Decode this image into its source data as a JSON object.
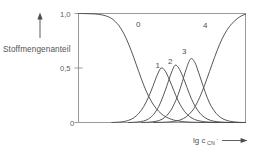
{
  "chart_data": {
    "type": "line",
    "title": "",
    "subtitle": "",
    "ylabel": "Stoffmengenanteil",
    "xlabel": "lg c",
    "xlabel_subscript": "CN",
    "xlabel_superscript": "-",
    "ylim": [
      0,
      1.0
    ],
    "xlim": [
      0,
      1
    ],
    "grid": false,
    "legend_position": "inline-curve-labels",
    "y_ticks": [
      {
        "value": 1.0,
        "label": "1,0"
      },
      {
        "value": 0.5,
        "label": "0,5"
      },
      {
        "value": 0.0,
        "label": "0"
      }
    ],
    "x_ticks": [],
    "x_axis_arrow": true,
    "y_axis_arrow": true,
    "annotations": [
      {
        "text": "0",
        "x": 0.29,
        "y": 0.88
      },
      {
        "text": "1",
        "x": 0.495,
        "y": 0.585
      },
      {
        "text": "2",
        "x": 0.585,
        "y": 0.615
      },
      {
        "text": "3",
        "x": 0.675,
        "y": 0.73
      },
      {
        "text": "4",
        "x": 0.8,
        "y": 0.875
      }
    ],
    "series": [
      {
        "name": "0",
        "label": "0",
        "peak_x": 0.0,
        "peak_y": 1.0,
        "points": [
          [
            0.0,
            1.0
          ],
          [
            0.04,
            0.999
          ],
          [
            0.08,
            0.997
          ],
          [
            0.12,
            0.992
          ],
          [
            0.16,
            0.98
          ],
          [
            0.2,
            0.952
          ],
          [
            0.24,
            0.893
          ],
          [
            0.27,
            0.82
          ],
          [
            0.3,
            0.72
          ],
          [
            0.33,
            0.6
          ],
          [
            0.36,
            0.47
          ],
          [
            0.39,
            0.345
          ],
          [
            0.42,
            0.24
          ],
          [
            0.45,
            0.16
          ],
          [
            0.48,
            0.103
          ],
          [
            0.51,
            0.064
          ],
          [
            0.54,
            0.039
          ],
          [
            0.57,
            0.023
          ],
          [
            0.6,
            0.013
          ],
          [
            0.65,
            0.005
          ],
          [
            0.7,
            0.002
          ],
          [
            0.8,
            0.0
          ],
          [
            1.0,
            0.0
          ]
        ]
      },
      {
        "name": "1",
        "label": "1",
        "peak_x": 0.495,
        "peak_y": 0.5,
        "points": [
          [
            0.2,
            0.0
          ],
          [
            0.26,
            0.006
          ],
          [
            0.3,
            0.02
          ],
          [
            0.33,
            0.042
          ],
          [
            0.36,
            0.082
          ],
          [
            0.39,
            0.145
          ],
          [
            0.42,
            0.235
          ],
          [
            0.445,
            0.33
          ],
          [
            0.47,
            0.43
          ],
          [
            0.495,
            0.5
          ],
          [
            0.52,
            0.47
          ],
          [
            0.545,
            0.39
          ],
          [
            0.57,
            0.295
          ],
          [
            0.595,
            0.205
          ],
          [
            0.62,
            0.135
          ],
          [
            0.65,
            0.075
          ],
          [
            0.68,
            0.04
          ],
          [
            0.71,
            0.02
          ],
          [
            0.75,
            0.008
          ],
          [
            0.8,
            0.002
          ],
          [
            0.87,
            0.0
          ],
          [
            1.0,
            0.0
          ]
        ]
      },
      {
        "name": "2",
        "label": "2",
        "peak_x": 0.578,
        "peak_y": 0.525,
        "points": [
          [
            0.3,
            0.0
          ],
          [
            0.35,
            0.004
          ],
          [
            0.39,
            0.014
          ],
          [
            0.42,
            0.034
          ],
          [
            0.45,
            0.075
          ],
          [
            0.48,
            0.145
          ],
          [
            0.505,
            0.235
          ],
          [
            0.53,
            0.34
          ],
          [
            0.555,
            0.452
          ],
          [
            0.578,
            0.525
          ],
          [
            0.6,
            0.5
          ],
          [
            0.625,
            0.42
          ],
          [
            0.65,
            0.32
          ],
          [
            0.675,
            0.222
          ],
          [
            0.7,
            0.145
          ],
          [
            0.73,
            0.08
          ],
          [
            0.76,
            0.042
          ],
          [
            0.79,
            0.02
          ],
          [
            0.83,
            0.007
          ],
          [
            0.88,
            0.002
          ],
          [
            0.94,
            0.0
          ],
          [
            1.0,
            0.0
          ]
        ]
      },
      {
        "name": "3",
        "label": "3",
        "peak_x": 0.672,
        "peak_y": 0.585,
        "points": [
          [
            0.38,
            0.0
          ],
          [
            0.43,
            0.004
          ],
          [
            0.47,
            0.013
          ],
          [
            0.5,
            0.03
          ],
          [
            0.53,
            0.066
          ],
          [
            0.56,
            0.13
          ],
          [
            0.59,
            0.23
          ],
          [
            0.615,
            0.34
          ],
          [
            0.645,
            0.49
          ],
          [
            0.672,
            0.585
          ],
          [
            0.697,
            0.55
          ],
          [
            0.72,
            0.455
          ],
          [
            0.745,
            0.34
          ],
          [
            0.77,
            0.232
          ],
          [
            0.795,
            0.148
          ],
          [
            0.825,
            0.082
          ],
          [
            0.855,
            0.042
          ],
          [
            0.89,
            0.018
          ],
          [
            0.93,
            0.006
          ],
          [
            0.97,
            0.001
          ],
          [
            1.0,
            0.0
          ]
        ]
      },
      {
        "name": "4",
        "label": "4",
        "peak_x": 1.0,
        "peak_y": 1.0,
        "points": [
          [
            0.45,
            0.0
          ],
          [
            0.52,
            0.003
          ],
          [
            0.57,
            0.01
          ],
          [
            0.61,
            0.024
          ],
          [
            0.645,
            0.052
          ],
          [
            0.68,
            0.105
          ],
          [
            0.71,
            0.18
          ],
          [
            0.74,
            0.283
          ],
          [
            0.77,
            0.405
          ],
          [
            0.8,
            0.535
          ],
          [
            0.83,
            0.66
          ],
          [
            0.86,
            0.768
          ],
          [
            0.89,
            0.85
          ],
          [
            0.92,
            0.91
          ],
          [
            0.95,
            0.952
          ],
          [
            0.975,
            0.978
          ],
          [
            1.0,
            0.993
          ]
        ]
      }
    ]
  }
}
